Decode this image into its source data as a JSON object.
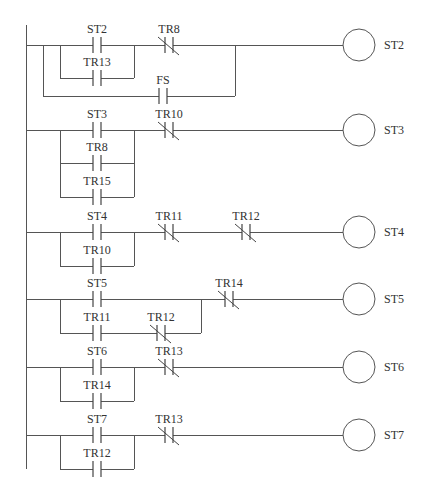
{
  "colors": {
    "line": "#555555",
    "text": "#333333",
    "background": "#ffffff"
  },
  "rail": {
    "x": 26,
    "y1": 25,
    "y2": 469
  },
  "coil": {
    "cx": 359,
    "r": 16,
    "label_x": 384
  },
  "rungs": [
    {
      "coil_label": "ST2",
      "y": 45,
      "contacts": [
        {
          "label": "ST2",
          "type": "NO",
          "x": 97,
          "y": 45
        },
        {
          "label": "TR13",
          "type": "NO",
          "x": 97,
          "y": 78
        },
        {
          "label": "TR8",
          "type": "NC",
          "x": 169,
          "y": 45
        },
        {
          "label": "FS",
          "type": "NO",
          "x": 163,
          "y": 96
        }
      ],
      "branches": [
        {
          "x1": 60,
          "x2": 134,
          "y": 78
        },
        {
          "x1": 43,
          "x2": 235,
          "y": 96
        }
      ]
    },
    {
      "coil_label": "ST3",
      "y": 130,
      "contacts": [
        {
          "label": "ST3",
          "type": "NO",
          "x": 97,
          "y": 130
        },
        {
          "label": "TR8",
          "type": "NO",
          "x": 97,
          "y": 163
        },
        {
          "label": "TR15",
          "type": "NO",
          "x": 97,
          "y": 197
        },
        {
          "label": "TR10",
          "type": "NC",
          "x": 169,
          "y": 130
        }
      ],
      "branches": [
        {
          "x1": 60,
          "x2": 134,
          "y": 163
        },
        {
          "x1": 60,
          "x2": 134,
          "y": 197
        }
      ]
    },
    {
      "coil_label": "ST4",
      "y": 232,
      "contacts": [
        {
          "label": "ST4",
          "type": "NO",
          "x": 97,
          "y": 232
        },
        {
          "label": "TR10",
          "type": "NO",
          "x": 97,
          "y": 266
        },
        {
          "label": "TR11",
          "type": "NC",
          "x": 169,
          "y": 232
        },
        {
          "label": "TR12",
          "type": "NC",
          "x": 246,
          "y": 232
        }
      ],
      "branches": [
        {
          "x1": 60,
          "x2": 134,
          "y": 266
        }
      ]
    },
    {
      "coil_label": "ST5",
      "y": 299,
      "contacts": [
        {
          "label": "ST5",
          "type": "NO",
          "x": 97,
          "y": 299
        },
        {
          "label": "TR11",
          "type": "NO",
          "x": 97,
          "y": 333
        },
        {
          "label": "TR12",
          "type": "NC",
          "x": 161,
          "y": 333
        },
        {
          "label": "TR14",
          "type": "NC",
          "x": 229,
          "y": 299
        }
      ],
      "branches": [
        {
          "x1": 60,
          "x2": 201,
          "y": 333
        }
      ]
    },
    {
      "coil_label": "ST6",
      "y": 367,
      "contacts": [
        {
          "label": "ST6",
          "type": "NO",
          "x": 97,
          "y": 367
        },
        {
          "label": "TR14",
          "type": "NO",
          "x": 97,
          "y": 401
        },
        {
          "label": "TR13",
          "type": "NC",
          "x": 169,
          "y": 367
        }
      ],
      "branches": [
        {
          "x1": 60,
          "x2": 134,
          "y": 401
        }
      ]
    },
    {
      "coil_label": "ST7",
      "y": 435,
      "contacts": [
        {
          "label": "ST7",
          "type": "NO",
          "x": 97,
          "y": 435
        },
        {
          "label": "TR12",
          "type": "NO",
          "x": 97,
          "y": 469
        },
        {
          "label": "TR13",
          "type": "NC",
          "x": 169,
          "y": 435
        }
      ],
      "branches": [
        {
          "x1": 60,
          "x2": 134,
          "y": 469
        }
      ]
    }
  ]
}
